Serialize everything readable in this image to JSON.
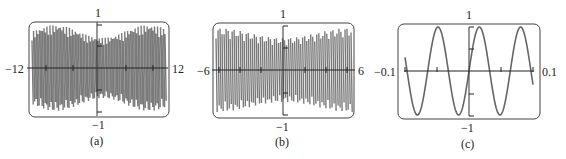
{
  "chart_data": [
    {
      "type": "line",
      "title": "",
      "caption": "(a)",
      "xlabel": "",
      "ylabel": "",
      "xlim": [
        -12,
        12
      ],
      "ylim": [
        -1,
        1
      ],
      "x_tick_labels": [
        "-12",
        "12"
      ],
      "y_tick_labels": [
        "1",
        "-1"
      ],
      "grid": false,
      "description": "Densely oscillating waveform filling the window; appears aliased/chaotic across [-12, 12]",
      "series": [
        {
          "name": "graph",
          "color": "#777777",
          "frequency_cycles_visible": 45
        }
      ]
    },
    {
      "type": "line",
      "title": "",
      "caption": "(b)",
      "xlabel": "",
      "ylabel": "",
      "xlim": [
        -6,
        6
      ],
      "ylim": [
        -1,
        1
      ],
      "x_tick_labels": [
        "-6",
        "6"
      ],
      "y_tick_labels": [
        "1",
        "-1"
      ],
      "grid": false,
      "description": "Rapid oscillation with slowly varying amplitude envelope across [-6, 6]",
      "series": [
        {
          "name": "graph",
          "color": "#777777",
          "frequency_cycles_visible": 34
        }
      ]
    },
    {
      "type": "line",
      "title": "",
      "caption": "(c)",
      "xlabel": "",
      "ylabel": "",
      "xlim": [
        -0.1,
        0.1
      ],
      "ylim": [
        -1,
        1
      ],
      "x_tick_labels": [
        "-0.1",
        "0.1"
      ],
      "y_tick_labels": [
        "1",
        "-1"
      ],
      "grid": false,
      "description": "Smooth sine wave, about 3 full periods in [-0.1, 0.1], passing through origin increasing",
      "series": [
        {
          "name": "graph",
          "color": "#666666",
          "periods_visible": 3.1
        }
      ]
    }
  ],
  "panels": [
    {
      "caption": "(a)",
      "xmin": "−12",
      "xmax": "12",
      "ymax": "1",
      "ymin": "−1"
    },
    {
      "caption": "(b)",
      "xmin": "−6",
      "xmax": "6",
      "ymax": "1",
      "ymin": "−1"
    },
    {
      "caption": "(c)",
      "xmin": "−0.1",
      "xmax": "0.1",
      "ymax": "1",
      "ymin": "−1"
    }
  ]
}
